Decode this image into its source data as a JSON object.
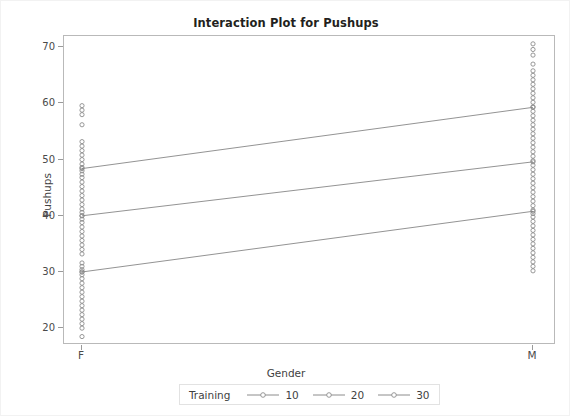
{
  "chart_data": {
    "type": "scatter",
    "title": "Interaction Plot for Pushups",
    "xlabel": "Gender",
    "ylabel": "Pushups",
    "categories": [
      "F",
      "M"
    ],
    "xtick_labels": [
      "F",
      "M"
    ],
    "ytick_labels": [
      "20",
      "30",
      "40",
      "50",
      "60",
      "70"
    ],
    "yticks": [
      20,
      30,
      40,
      50,
      60,
      70
    ],
    "ylim": [
      17,
      72
    ],
    "grid": false,
    "legend_position": "bottom-center",
    "legend_title": "Training",
    "marker": "open-circle",
    "line_color": "#808080",
    "marker_color": "#8c8c8c",
    "series": [
      {
        "name": "10",
        "values": [
          30.0,
          40.8
        ]
      },
      {
        "name": "20",
        "values": [
          40.0,
          49.6
        ]
      },
      {
        "name": "30",
        "values": [
          48.4,
          59.3
        ]
      }
    ],
    "raw_points": {
      "F": [
        18.5,
        20.0,
        20.8,
        21.6,
        22.4,
        23.2,
        24.0,
        24.8,
        25.6,
        26.4,
        27.2,
        28.0,
        28.8,
        29.5,
        30.0,
        30.4,
        31.0,
        31.6,
        33.2,
        34.0,
        34.8,
        35.6,
        36.4,
        37.2,
        38.0,
        38.8,
        39.4,
        40.0,
        40.6,
        41.2,
        42.0,
        42.8,
        43.6,
        44.4,
        45.2,
        46.0,
        46.8,
        47.4,
        48.0,
        48.6,
        49.2,
        50.0,
        50.8,
        51.6,
        52.4,
        53.2,
        56.2,
        58.0,
        58.8,
        59.6
      ],
      "M": [
        30.2,
        31.0,
        31.8,
        32.6,
        33.4,
        34.2,
        35.0,
        35.8,
        36.6,
        37.4,
        38.2,
        39.0,
        39.8,
        40.4,
        41.0,
        41.8,
        42.6,
        43.4,
        44.2,
        45.0,
        45.8,
        46.6,
        47.4,
        48.2,
        49.0,
        49.8,
        50.6,
        51.4,
        52.2,
        53.0,
        53.8,
        54.6,
        55.4,
        56.2,
        57.0,
        57.8,
        58.6,
        59.4,
        60.2,
        61.0,
        61.8,
        62.6,
        63.4,
        64.2,
        65.0,
        65.8,
        67.0,
        68.6,
        69.6,
        70.6
      ]
    }
  }
}
